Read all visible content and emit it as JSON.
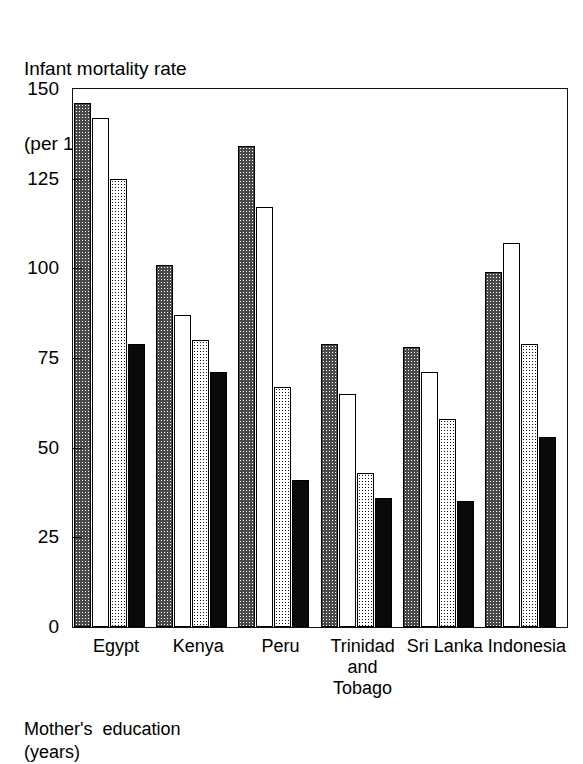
{
  "chart_data": {
    "type": "bar",
    "title": "Infant mortality rate\n(per 1,000 live births)",
    "title_line1": "Infant mortality rate",
    "title_line2": "(per 1,000 live births)",
    "xlabel": "",
    "ylabel": "Infant mortality rate (per 1,000 live births)",
    "ylim": [
      0,
      150
    ],
    "yticks": [
      0,
      25,
      50,
      75,
      100,
      125,
      150
    ],
    "ytick_labels": [
      "0",
      "25",
      "50",
      "75",
      "100",
      "125",
      "150"
    ],
    "grid": false,
    "legend_position": "below-chart",
    "legend_title": "Mother's education\n(years)",
    "categories": [
      "Egypt",
      "Kenya",
      "Peru",
      "Trinidad\nand\nTobago",
      "Sri Lanka",
      "Indonesia"
    ],
    "series": [
      {
        "name": "series-1",
        "pattern": "light-checker",
        "values": [
          146,
          101,
          134,
          79,
          78,
          99
        ]
      },
      {
        "name": "series-2",
        "pattern": "hollow",
        "values": [
          142,
          87,
          117,
          65,
          71,
          107
        ]
      },
      {
        "name": "series-3",
        "pattern": "dark-checker",
        "values": [
          125,
          80,
          67,
          43,
          58,
          79
        ]
      },
      {
        "name": "series-4",
        "pattern": "solid-black",
        "values": [
          79,
          71,
          41,
          36,
          35,
          53
        ]
      }
    ]
  },
  "footer": {
    "line1": "Mother's  education",
    "line2": "(years)"
  },
  "colors": {
    "axis": "#111111",
    "bar_outline": "#000000",
    "light_fill": "#ffffff",
    "dark_fill": "#151515",
    "solid_fill": "#0a0a0a",
    "background": "#ffffff"
  }
}
